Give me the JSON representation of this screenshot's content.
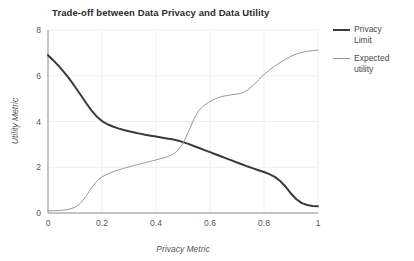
{
  "chart_data": {
    "type": "line",
    "title": "Trade-off between Data Privacy and Data Utility",
    "xlabel": "Privacy Metric",
    "ylabel": "Utility Metric",
    "xlim": [
      0,
      1
    ],
    "ylim": [
      0,
      8
    ],
    "xticks": [
      "0",
      "0.2",
      "0.4",
      "0.6",
      "0.8",
      "1"
    ],
    "xtick_values": [
      0,
      0.2,
      0.4,
      0.6,
      0.8,
      1
    ],
    "yticks": [
      "0",
      "2",
      "4",
      "6",
      "8"
    ],
    "ytick_values": [
      0,
      2,
      4,
      6,
      8
    ],
    "grid": true,
    "legend_position": "right",
    "x": [
      0,
      0.02,
      0.04,
      0.06,
      0.08,
      0.1,
      0.12,
      0.14,
      0.16,
      0.18,
      0.2,
      0.22,
      0.24,
      0.26,
      0.28,
      0.3,
      0.32,
      0.34,
      0.36,
      0.38,
      0.4,
      0.42,
      0.44,
      0.46,
      0.48,
      0.5,
      0.52,
      0.54,
      0.56,
      0.58,
      0.6,
      0.62,
      0.64,
      0.66,
      0.68,
      0.7,
      0.72,
      0.74,
      0.76,
      0.78,
      0.8,
      0.82,
      0.84,
      0.86,
      0.88,
      0.9,
      0.92,
      0.94,
      0.96,
      0.98,
      1
    ],
    "series": [
      {
        "name": "Privacy Limit",
        "color": "#3a3a3a",
        "width": 2.0,
        "values": [
          6.9,
          6.67,
          6.42,
          6.15,
          5.85,
          5.52,
          5.18,
          4.83,
          4.5,
          4.22,
          4.02,
          3.88,
          3.78,
          3.7,
          3.63,
          3.57,
          3.52,
          3.47,
          3.42,
          3.38,
          3.34,
          3.3,
          3.26,
          3.22,
          3.17,
          3.1,
          3.02,
          2.93,
          2.84,
          2.75,
          2.66,
          2.57,
          2.48,
          2.39,
          2.3,
          2.21,
          2.12,
          2.03,
          1.95,
          1.87,
          1.79,
          1.7,
          1.58,
          1.4,
          1.15,
          0.85,
          0.6,
          0.43,
          0.35,
          0.31,
          0.3
        ]
      },
      {
        "name": "Expected utility",
        "color": "#9a9a9a",
        "width": 1.0,
        "values": [
          0.1,
          0.1,
          0.11,
          0.13,
          0.17,
          0.25,
          0.42,
          0.72,
          1.08,
          1.38,
          1.58,
          1.7,
          1.8,
          1.88,
          1.95,
          2.02,
          2.08,
          2.14,
          2.2,
          2.26,
          2.32,
          2.38,
          2.45,
          2.55,
          2.72,
          3.05,
          3.55,
          4.1,
          4.5,
          4.72,
          4.88,
          5.0,
          5.08,
          5.13,
          5.17,
          5.2,
          5.25,
          5.38,
          5.58,
          5.82,
          6.05,
          6.25,
          6.42,
          6.58,
          6.72,
          6.85,
          6.95,
          7.02,
          7.07,
          7.1,
          7.12
        ]
      }
    ]
  },
  "legend": {
    "items": [
      {
        "label_line1": "Privacy",
        "label_line2": "Limit"
      },
      {
        "label_line1": "Expected",
        "label_line2": "utility"
      }
    ]
  }
}
